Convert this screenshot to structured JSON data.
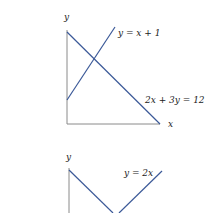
{
  "colors": {
    "line": "#3b5998",
    "axis": "#8a8a8a",
    "text": "#222222"
  },
  "diagram1": {
    "y_axis_label": "y",
    "x_axis_label": "x",
    "line1_label": "y = x + 1",
    "line2_label": "2x + 3y = 12"
  },
  "diagram2": {
    "y_axis_label": "y",
    "line1_label": "y = 2x"
  }
}
